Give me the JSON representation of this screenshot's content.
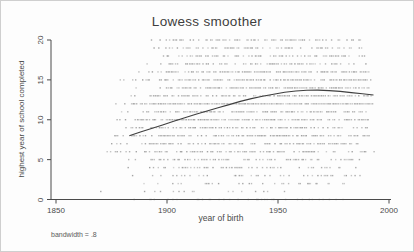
{
  "figure": {
    "kind": "stata-lowess-graph"
  },
  "chart_data": {
    "type": "scatter",
    "subtype": "scatter-with-lowess-curve",
    "title": "Lowess smoother",
    "xlabel": "year of birth",
    "ylabel": "highest year of school completed",
    "note": "bandwidth = .8",
    "xlim": [
      1850,
      2000
    ],
    "ylim": [
      0,
      20
    ],
    "x_ticks": [
      1850,
      1900,
      1950,
      2000
    ],
    "y_ticks": [
      0,
      5,
      10,
      15,
      20
    ],
    "grid": false,
    "legend": "none",
    "colors": {
      "dot": "#9b9b9b",
      "curve": "#3f3f3f",
      "axis": "#4a4a4a",
      "text": "#4a4a4a",
      "background": "#fdfdfd"
    },
    "lowess_curve": [
      [
        1883,
        8.0
      ],
      [
        1888,
        8.45
      ],
      [
        1893,
        8.9
      ],
      [
        1898,
        9.35
      ],
      [
        1903,
        9.8
      ],
      [
        1908,
        10.25
      ],
      [
        1913,
        10.7
      ],
      [
        1918,
        11.1
      ],
      [
        1923,
        11.5
      ],
      [
        1928,
        11.9
      ],
      [
        1933,
        12.3
      ],
      [
        1938,
        12.65
      ],
      [
        1943,
        12.95
      ],
      [
        1948,
        13.2
      ],
      [
        1953,
        13.45
      ],
      [
        1958,
        13.6
      ],
      [
        1963,
        13.7
      ],
      [
        1968,
        13.72
      ],
      [
        1973,
        13.65
      ],
      [
        1978,
        13.55
      ],
      [
        1983,
        13.4
      ],
      [
        1988,
        13.25
      ],
      [
        1993,
        13.1
      ]
    ],
    "scatter_bands": [
      {
        "value": 20,
        "from": 1888,
        "to": 1987,
        "density": 0.55
      },
      {
        "value": 19,
        "from": 1890,
        "to": 1988,
        "density": 0.5
      },
      {
        "value": 18,
        "from": 1892,
        "to": 1989,
        "density": 0.5
      },
      {
        "value": 17,
        "from": 1886,
        "to": 1990,
        "density": 0.55
      },
      {
        "value": 16,
        "from": 1884,
        "to": 1991,
        "density": 0.7
      },
      {
        "value": 15,
        "from": 1878,
        "to": 1992,
        "density": 0.7
      },
      {
        "value": 14,
        "from": 1882,
        "to": 1992,
        "density": 0.75
      },
      {
        "value": 13,
        "from": 1879,
        "to": 1992,
        "density": 0.7
      },
      {
        "value": 12,
        "from": 1873,
        "to": 1993,
        "density": 0.95
      },
      {
        "value": 11,
        "from": 1876,
        "to": 1991,
        "density": 0.7
      },
      {
        "value": 10,
        "from": 1874,
        "to": 1991,
        "density": 0.8
      },
      {
        "value": 9,
        "from": 1875,
        "to": 1990,
        "density": 0.65
      },
      {
        "value": 8,
        "from": 1873,
        "to": 1991,
        "density": 0.75
      },
      {
        "value": 7,
        "from": 1874,
        "to": 1986,
        "density": 0.6
      },
      {
        "value": 6,
        "from": 1872,
        "to": 1993,
        "density": 0.55
      },
      {
        "value": 5,
        "from": 1877,
        "to": 1987,
        "density": 0.5
      },
      {
        "value": 4,
        "from": 1879,
        "to": 1985,
        "density": 0.42
      },
      {
        "value": 3,
        "from": 1881,
        "to": 1987,
        "density": 0.35
      },
      {
        "value": 2,
        "from": 1884,
        "to": 1982,
        "density": 0.25
      },
      {
        "value": 1,
        "from": 1866,
        "to": 1975,
        "density": 0.15
      },
      {
        "value": 0,
        "from": 1878,
        "to": 1980,
        "density": 0.3
      }
    ]
  }
}
